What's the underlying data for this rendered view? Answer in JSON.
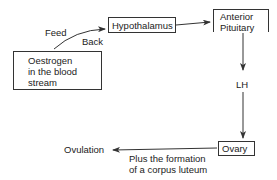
{
  "diagram": {
    "nodes": {
      "oestrogen": {
        "lines": [
          "Oestrogen",
          "in the blood",
          "stream"
        ]
      },
      "hypothalamus": {
        "label": "Hypothalamus"
      },
      "anterior_pituitary": {
        "lines": [
          "Anterior",
          "Pituitary"
        ]
      },
      "ovary": {
        "label": "Ovary"
      }
    },
    "edge_labels": {
      "feed": "Feed",
      "back": "Back",
      "lh": "LH",
      "ovulation": "Ovulation",
      "corpus_luteum": [
        "Plus the formation",
        "of a corpus luteum"
      ]
    },
    "edges": [
      {
        "from": "oestrogen",
        "to": "hypothalamus",
        "label": "Feed Back"
      },
      {
        "from": "hypothalamus",
        "to": "anterior_pituitary"
      },
      {
        "from": "anterior_pituitary",
        "to": "ovary",
        "label": "LH"
      },
      {
        "from": "ovary",
        "to": "ovulation",
        "label": "Plus the formation of a corpus luteum"
      }
    ],
    "colors": {
      "line": "#333333",
      "text": "#222222",
      "background": "#ffffff"
    }
  }
}
